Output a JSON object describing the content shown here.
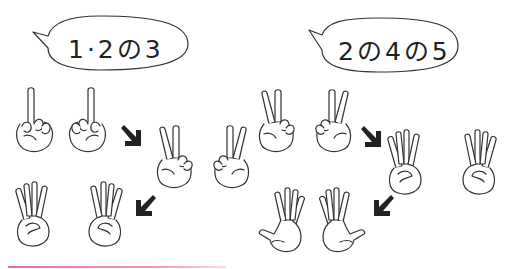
{
  "panels": [
    {
      "bubble": {
        "text": "1·2の3"
      },
      "steps": [
        "one",
        "two",
        "three"
      ]
    },
    {
      "bubble": {
        "text": "2の4の5"
      },
      "steps": [
        "two",
        "four",
        "five"
      ]
    }
  ],
  "colors": {
    "line": "#333333",
    "arrow": "#222222",
    "underline": "#ec6f8e",
    "background": "#ffffff"
  }
}
